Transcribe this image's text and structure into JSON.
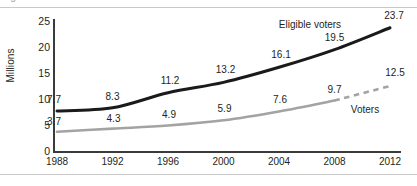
{
  "figure": {
    "cropped_caption_fragment": "g",
    "axis_color": "#3b3b3b",
    "rule_color": "#c9c9c9"
  },
  "chart_data": {
    "type": "line",
    "title": "",
    "xlabel": "",
    "ylabel": "Millions",
    "categories": [
      "1988",
      "1992",
      "1996",
      "2000",
      "2004",
      "2008",
      "2012"
    ],
    "x": [
      1988,
      1992,
      1996,
      2000,
      2004,
      2008,
      2012
    ],
    "ylim": [
      0,
      25
    ],
    "yticks": [
      "0",
      "5",
      "10",
      "15",
      "20",
      "25"
    ],
    "grid": false,
    "legend": "inline-annotations",
    "series": [
      {
        "name": "Eligible voters",
        "color": "#1a1a1a",
        "width": 3,
        "style": "solid",
        "values": [
          7.7,
          8.3,
          11.2,
          13.2,
          16.1,
          19.5,
          23.7
        ],
        "labels": [
          "7.7",
          "8.3",
          "11.2",
          "13.2",
          "16.1",
          "19.5",
          "23.7"
        ],
        "annotation": "Eligible voters"
      },
      {
        "name": "Voters",
        "color": "#a3a3a3",
        "width": 2.6,
        "style": "solid-with-dashed-projection",
        "dashed_from_index": 5,
        "values": [
          3.7,
          4.3,
          4.9,
          5.9,
          7.6,
          9.7,
          12.5
        ],
        "labels": [
          "3.7",
          "4.3",
          "4.9",
          "5.9",
          "7.6",
          "9.7",
          "12.5"
        ],
        "annotation": "Voters"
      }
    ]
  }
}
